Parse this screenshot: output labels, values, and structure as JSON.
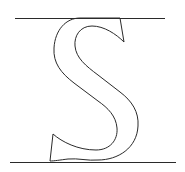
{
  "figure": {
    "glyph": "S",
    "colors": {
      "stroke": "#2a2a2a",
      "background": "#ffffff"
    },
    "guides": {
      "top": {
        "x1": 15,
        "y1": 18,
        "x2": 165,
        "y2": 18
      },
      "bottom": {
        "x1": 10,
        "y1": 162,
        "x2": 176,
        "y2": 162
      }
    }
  }
}
